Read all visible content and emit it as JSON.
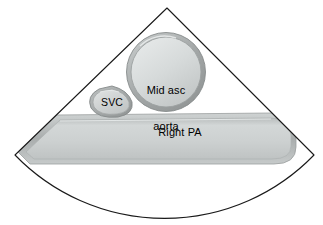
{
  "figure": {
    "type": "echocardiogram-sector-diagram",
    "modality": "ultrasound sector scan",
    "background_color": "#ffffff",
    "outline_color": "#1a1a1a",
    "text_color": "#000000"
  },
  "sector": {
    "name": "ultrasound-sector",
    "apex": {
      "x": 167,
      "y": 8
    },
    "left_corner": {
      "x": 15,
      "y": 155
    },
    "right_corner": {
      "x": 314,
      "y": 155
    },
    "arc_bottom_center": {
      "x": 166,
      "y": 212
    },
    "stroke_width": 1.1
  },
  "structures": [
    {
      "id": "mid-asc-aorta",
      "label": "Mid asc\naorta",
      "label_line1": "Mid asc",
      "label_line2": "aorta",
      "shape": "circle",
      "center": {
        "x": 166,
        "y": 72
      },
      "radius": 38,
      "wall_color": "#a8acac",
      "lumen_color": "#d2d6d6",
      "label_position": {
        "x": 166,
        "y": 72
      }
    },
    {
      "id": "svc",
      "label": "SVC",
      "shape": "rounded-triangle",
      "center": {
        "x": 111,
        "y": 102
      },
      "width": 44,
      "height": 31,
      "wall_color": "#a8acac",
      "lumen_color": "#cfd3d3",
      "label_position": {
        "x": 111,
        "y": 102
      }
    },
    {
      "id": "right-pa",
      "label": "Right PA",
      "shape": "tapered-tube",
      "left_tip": {
        "x": 18,
        "y": 152
      },
      "right_end": {
        "x": 292,
        "y": 150
      },
      "wall_color": "#b0b4b4",
      "lumen_color": "#cdd1d1",
      "label_position": {
        "x": 180,
        "y": 132
      }
    }
  ],
  "labels": {
    "aorta_line1": "Mid asc",
    "aorta_line2": "aorta",
    "svc": "SVC",
    "right_pa": "Right PA"
  }
}
